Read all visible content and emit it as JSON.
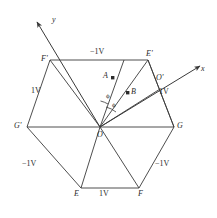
{
  "figure": {
    "type": "geometry-diagram",
    "stroke_color": "#3a3a3a",
    "text_color": "#2b2b2b"
  },
  "axes": {
    "x_label": "x",
    "y_label": "y"
  },
  "vertices": {
    "center": "O",
    "top_left": "F'",
    "top_right": "E'",
    "right": "G",
    "bottom_right": "F",
    "bottom_left": "E",
    "left": "G'"
  },
  "points": {
    "a": "A",
    "b": "B",
    "o_prime": "O'"
  },
  "angles": {
    "phi_1": "ϕ",
    "phi_2": "ϕ"
  },
  "edge_labels": {
    "top": "−1V",
    "upper_left": "1V",
    "lower_left": "−1V",
    "bottom": "1V",
    "lower_right": "−1V",
    "upper_right": "1V"
  }
}
